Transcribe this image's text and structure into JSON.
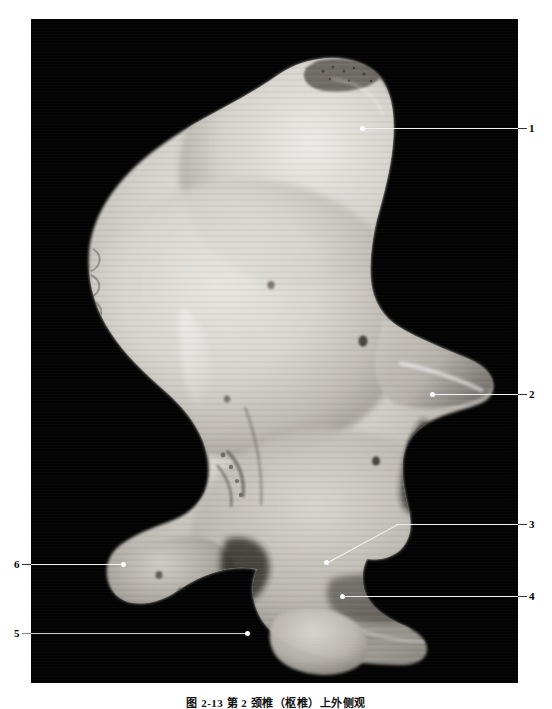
{
  "figure": {
    "caption": "图 2-13   第 2 颈椎（枢椎）上外侧观",
    "plate_background_color": "#030303",
    "page_background_color": "#ffffff",
    "leader_color": "#f2f2f2"
  },
  "callouts": [
    {
      "number": "1",
      "side": "right"
    },
    {
      "number": "2",
      "side": "right"
    },
    {
      "number": "3",
      "side": "right"
    },
    {
      "number": "4",
      "side": "right"
    },
    {
      "number": "5",
      "side": "left"
    },
    {
      "number": "6",
      "side": "left"
    }
  ]
}
